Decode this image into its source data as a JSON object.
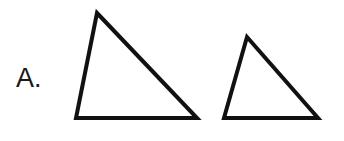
{
  "figure": {
    "background_color": "#ffffff",
    "stroke_color": "#111111",
    "width": 344,
    "height": 141,
    "label": {
      "text": "A.",
      "color": "#1a1a1a",
      "font_size_px": 27
    },
    "shapes": [
      {
        "name": "large-triangle",
        "type": "triangle",
        "stroke_width_px": 4,
        "fill": "none",
        "points": "97,13 197,118 76,118",
        "vertices": [
          {
            "label": "apex",
            "x": 97,
            "y": 13
          },
          {
            "label": "bottom-right",
            "x": 197,
            "y": 118
          },
          {
            "label": "bottom-left",
            "x": 76,
            "y": 118
          }
        ]
      },
      {
        "name": "small-triangle",
        "type": "triangle",
        "stroke_width_px": 4,
        "fill": "none",
        "points": "247,37 318,118 224,118",
        "vertices": [
          {
            "label": "apex",
            "x": 247,
            "y": 37
          },
          {
            "label": "bottom-right",
            "x": 318,
            "y": 118
          },
          {
            "label": "bottom-left",
            "x": 224,
            "y": 118
          }
        ]
      }
    ]
  }
}
